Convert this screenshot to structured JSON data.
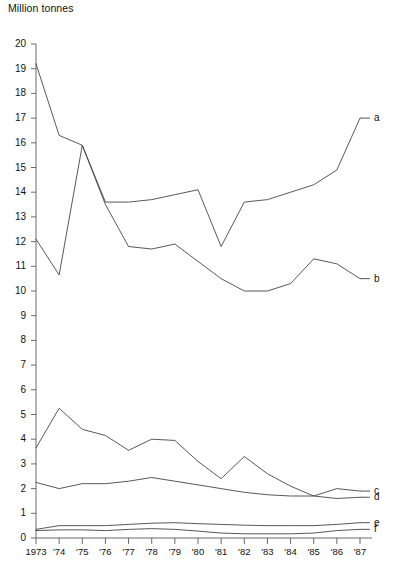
{
  "chart_data": {
    "type": "line",
    "title": "Million tonnes",
    "ylabel": "Million tonnes",
    "xlabel": "",
    "ylim": [
      0,
      20
    ],
    "yticks": [
      0,
      1,
      2,
      3,
      4,
      5,
      6,
      7,
      8,
      9,
      10,
      11,
      12,
      13,
      14,
      15,
      16,
      17,
      18,
      19,
      20
    ],
    "ytick_labels": [
      "0",
      "1",
      "2",
      "3",
      "4",
      "5",
      "6",
      "7",
      "8",
      "9",
      "10",
      "11",
      "12",
      "13",
      "14",
      "15",
      "16",
      "17",
      "18",
      "19",
      "20"
    ],
    "grid": false,
    "legend_position": "right-inline",
    "categories": [
      "1973",
      "'74",
      "'75",
      "'76",
      "'77",
      "'78",
      "'79",
      "'80",
      "'81",
      "'82",
      "'83",
      "'84",
      "'85",
      "'86",
      "'87"
    ],
    "x_values": [
      1973,
      1974,
      1975,
      1976,
      1977,
      1978,
      1979,
      1980,
      1981,
      1982,
      1983,
      1984,
      1985,
      1986,
      1987
    ],
    "series": [
      {
        "name": "a",
        "label": "a",
        "values": [
          19.2,
          16.3,
          15.9,
          13.6,
          13.6,
          13.7,
          13.9,
          14.1,
          11.8,
          13.6,
          13.7,
          14.0,
          14.3,
          14.9,
          17.0
        ]
      },
      {
        "name": "b",
        "label": "b",
        "values": [
          12.1,
          10.65,
          15.9,
          13.5,
          11.8,
          11.7,
          11.9,
          11.2,
          10.5,
          10.0,
          10.0,
          10.3,
          11.3,
          11.1,
          10.5
        ]
      },
      {
        "name": "c",
        "label": "c",
        "values": [
          3.65,
          5.25,
          4.4,
          4.15,
          3.55,
          4.0,
          3.95,
          3.1,
          2.4,
          3.3,
          2.6,
          2.1,
          1.7,
          2.0,
          1.9
        ]
      },
      {
        "name": "d",
        "label": "d",
        "values": [
          2.25,
          2.0,
          2.2,
          2.2,
          2.3,
          2.45,
          2.3,
          2.15,
          2.0,
          1.85,
          1.75,
          1.7,
          1.7,
          1.6,
          1.65
        ]
      },
      {
        "name": "e",
        "label": "e",
        "values": [
          0.35,
          0.5,
          0.5,
          0.5,
          0.55,
          0.6,
          0.62,
          0.58,
          0.55,
          0.52,
          0.5,
          0.5,
          0.5,
          0.55,
          0.62
        ]
      },
      {
        "name": "f",
        "label": "f",
        "values": [
          0.3,
          0.33,
          0.33,
          0.3,
          0.35,
          0.38,
          0.35,
          0.28,
          0.2,
          0.17,
          0.17,
          0.17,
          0.2,
          0.3,
          0.35
        ]
      }
    ],
    "line_color": "#3a3a3a"
  }
}
